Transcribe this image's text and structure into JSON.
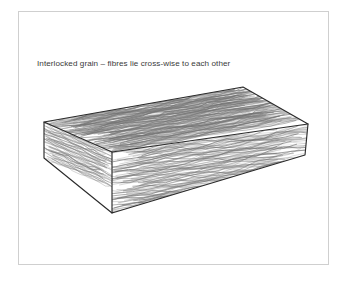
{
  "figure": {
    "caption": "Interlocked grain – fibres lie cross-wise to each other",
    "background_color": "#ffffff",
    "frame_color": "#cfcfcf",
    "ink_color": "#2b2b2b",
    "grain_color": "#555555",
    "faces": [
      {
        "name": "top-face",
        "label": "top face"
      },
      {
        "name": "front-face",
        "label": "front long face"
      },
      {
        "name": "end-face",
        "label": "left end face"
      }
    ],
    "geometry": {
      "top_back_left": [
        44,
        122
      ],
      "top_back_right": [
        243,
        87
      ],
      "top_front_right": [
        308,
        124
      ],
      "top_front_left": [
        112,
        152
      ],
      "bottom_front_left": [
        112,
        213
      ],
      "bottom_front_right": [
        305,
        155
      ],
      "bottom_back_left": [
        44,
        158
      ]
    }
  }
}
